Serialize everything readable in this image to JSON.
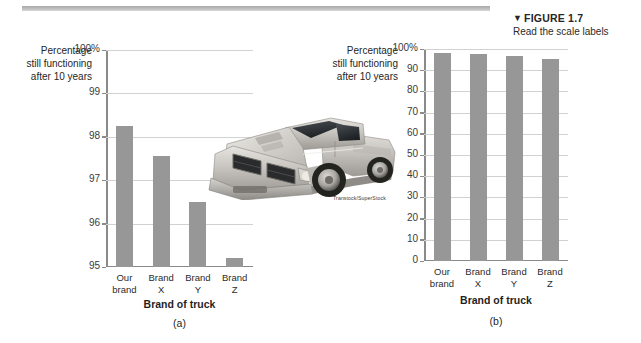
{
  "figure": {
    "arrow_glyph": "▼",
    "title": "FIGURE 1.7",
    "subtitle": "Read the scale labels"
  },
  "photo": {
    "alt_name": "pickup-truck-photo",
    "credit": "Transtock/SuperStock"
  },
  "chart_data": [
    {
      "id": "a",
      "type": "bar",
      "title": "",
      "panel_letter": "(a)",
      "categories": [
        "Our\nbrand",
        "Brand\nX",
        "Brand\nY",
        "Brand\nZ"
      ],
      "values": [
        98.25,
        97.55,
        96.5,
        95.2
      ],
      "xlabel": "Brand of truck",
      "ylabel": "Percentage\nstill functioning\nafter 10 years",
      "ylim": [
        95,
        100
      ],
      "yticks": [
        95,
        96,
        97,
        98,
        99,
        100
      ],
      "ytick_labels": [
        "95",
        "96",
        "97",
        "98",
        "99",
        "100%"
      ],
      "grid": true,
      "legend": "none"
    },
    {
      "id": "b",
      "type": "bar",
      "title": "",
      "panel_letter": "(b)",
      "categories": [
        "Our\nbrand",
        "Brand\nX",
        "Brand\nY",
        "Brand\nZ"
      ],
      "values": [
        98.25,
        97.55,
        96.5,
        95.2
      ],
      "xlabel": "Brand of truck",
      "ylabel": "Percentage\nstill functioning\nafter 10 years",
      "ylim": [
        0,
        100
      ],
      "yticks": [
        0,
        10,
        20,
        30,
        40,
        50,
        60,
        70,
        80,
        90,
        100
      ],
      "ytick_labels": [
        "0",
        "10",
        "20",
        "30",
        "40",
        "50",
        "60",
        "70",
        "80",
        "90",
        "100%"
      ],
      "grid": true,
      "legend": "none"
    }
  ],
  "colors": {
    "bar": "#979797",
    "gridline": "#d2d2d2",
    "axis": "#8a8a8a",
    "text": "#2b2b2b",
    "rule": "#b5b5b5"
  }
}
